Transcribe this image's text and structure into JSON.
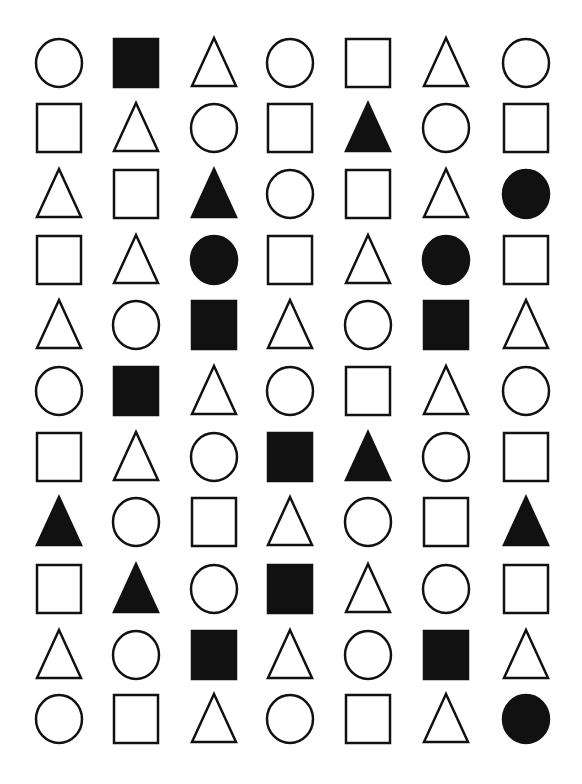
{
  "worksheet": {
    "background": "#ffffff",
    "ink_color": "#111111",
    "columns": 7,
    "rows": 11,
    "column_x_centers": [
      59,
      136,
      214,
      290,
      368,
      446,
      526
    ],
    "row_y_centers": [
      63,
      128,
      194,
      260,
      325,
      391,
      457,
      522,
      589,
      655,
      719
    ],
    "legend": {
      "C": "circle",
      "S": "square",
      "T": "triangle",
      "filled_suffix": "f"
    },
    "grid": [
      [
        "C",
        "Sf",
        "T",
        "C",
        "S",
        "T",
        "C"
      ],
      [
        "S",
        "T",
        "C",
        "S",
        "Tf",
        "C",
        "S"
      ],
      [
        "T",
        "S",
        "Tf",
        "C",
        "S",
        "T",
        "Cf"
      ],
      [
        "S",
        "T",
        "Cf",
        "S",
        "T",
        "Cf",
        "S"
      ],
      [
        "T",
        "C",
        "Sf",
        "T",
        "C",
        "Sf",
        "T"
      ],
      [
        "C",
        "Sf",
        "T",
        "C",
        "S",
        "T",
        "C"
      ],
      [
        "S",
        "T",
        "C",
        "Sf",
        "Tf",
        "C",
        "S"
      ],
      [
        "Tf",
        "C",
        "S",
        "T",
        "C",
        "S",
        "Tf"
      ],
      [
        "S",
        "Tf",
        "C",
        "Sf",
        "T",
        "C",
        "S"
      ],
      [
        "T",
        "C",
        "Sf",
        "T",
        "C",
        "Sf",
        "T"
      ],
      [
        "C",
        "S",
        "T",
        "C",
        "S",
        "T",
        "Cf"
      ]
    ]
  }
}
